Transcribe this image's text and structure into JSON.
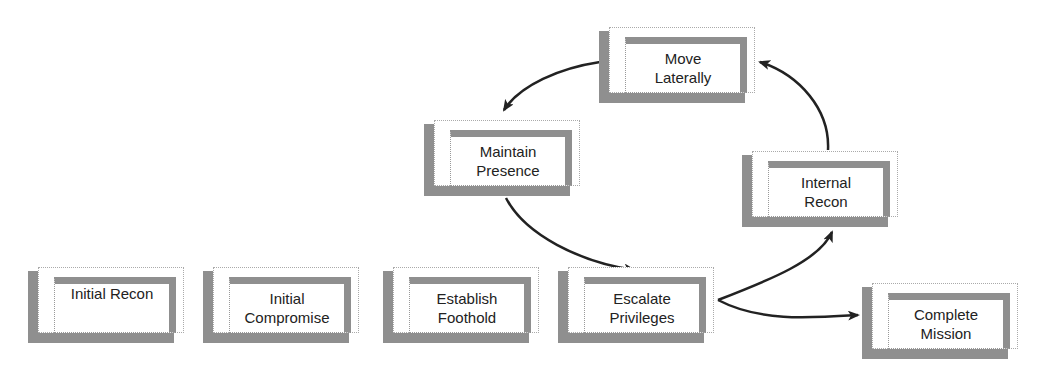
{
  "diagram": {
    "type": "attack-lifecycle",
    "nodes": [
      {
        "id": "initial-recon",
        "label": "Initial Recon",
        "x": 28,
        "y": 267,
        "align": "top"
      },
      {
        "id": "initial-compromise",
        "label": "Initial\nCompromise",
        "x": 203,
        "y": 267
      },
      {
        "id": "establish-foothold",
        "label": "Establish\nFoothold",
        "x": 383,
        "y": 267
      },
      {
        "id": "escalate-privileges",
        "label": "Escalate\nPrivileges",
        "x": 558,
        "y": 267
      },
      {
        "id": "complete-mission",
        "label": "Complete\nMission",
        "x": 862,
        "y": 283
      },
      {
        "id": "maintain-presence",
        "label": "Maintain\nPresence",
        "x": 424,
        "y": 120
      },
      {
        "id": "internal-recon",
        "label": "Internal\nRecon",
        "x": 742,
        "y": 151
      },
      {
        "id": "move-laterally",
        "label": "Move\nLaterally",
        "x": 599,
        "y": 27
      }
    ],
    "edges": [
      {
        "from": "escalate-privileges",
        "to": "internal-recon"
      },
      {
        "from": "internal-recon",
        "to": "move-laterally"
      },
      {
        "from": "move-laterally",
        "to": "maintain-presence"
      },
      {
        "from": "maintain-presence",
        "to": "escalate-privileges"
      },
      {
        "from": "escalate-privileges",
        "to": "complete-mission"
      }
    ],
    "colors": {
      "shadow": "#8f8f8f",
      "arrow": "#222222",
      "text": "#222222"
    }
  }
}
